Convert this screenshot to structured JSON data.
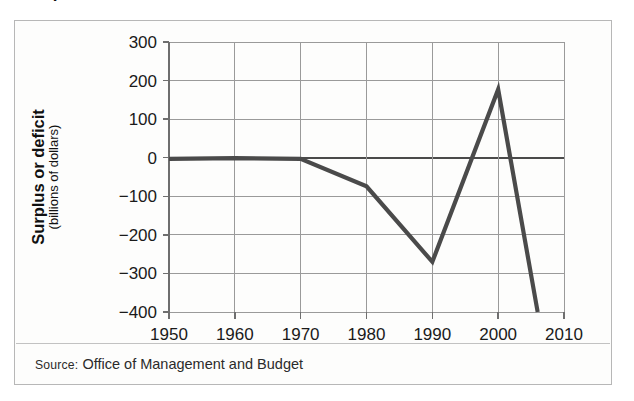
{
  "figure": {
    "title": "Surplus or deficit",
    "source_label": "Source:",
    "source_text": "Office of Management and Budget",
    "axis_title_main": "Surplus or deficit",
    "axis_title_sub": "(billions of dollars)"
  },
  "colors": {
    "line": "#4a4a4a",
    "grid": "#9a9a9a",
    "axis": "#6e6e6e",
    "zero_axis": "#4a4a4a",
    "frame": "#b7b7b7",
    "background": "#fdfdfc",
    "text": "#1a1a1a"
  },
  "chart_data": {
    "type": "line",
    "title": "Surplus or deficit",
    "xlabel": "",
    "ylabel": "Surplus or deficit (billions of dollars)",
    "ylabel_main": "Surplus or deficit",
    "ylabel_sub": "(billions of dollars)",
    "xlim": [
      1950,
      2010
    ],
    "ylim": [
      -400,
      300
    ],
    "xticks": [
      1950,
      1960,
      1970,
      1980,
      1990,
      2000,
      2010
    ],
    "xtick_labels": [
      "1950",
      "1960",
      "1970",
      "1980",
      "1990",
      "2000",
      "2010"
    ],
    "yticks": [
      300,
      200,
      100,
      0,
      -100,
      -200,
      -300,
      -400
    ],
    "ytick_labels": [
      "300",
      "200",
      "100",
      "0",
      "−100",
      "−200",
      "−300",
      "−400"
    ],
    "grid": true,
    "legend": false,
    "zero_line": true,
    "x": [
      1950,
      1960,
      1970,
      1980,
      1990,
      2000,
      2006
    ],
    "values": [
      -3,
      -1,
      -3,
      -74,
      -270,
      177,
      -400
    ],
    "series": [
      {
        "name": "Federal surplus or deficit",
        "x": [
          1950,
          1960,
          1970,
          1980,
          1990,
          2000,
          2006
        ],
        "values": [
          -3,
          -1,
          -3,
          -74,
          -270,
          177,
          -400
        ]
      }
    ],
    "annotations": [],
    "source": "Office of Management and Budget"
  }
}
